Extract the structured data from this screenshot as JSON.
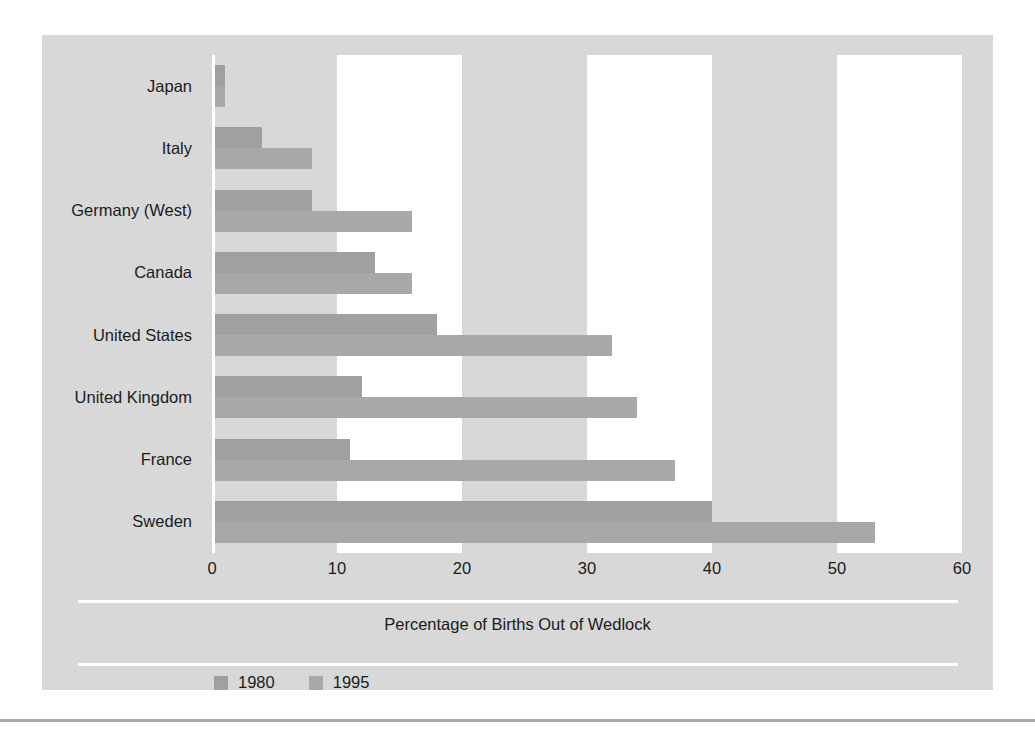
{
  "chart_data": {
    "type": "bar",
    "orientation": "horizontal",
    "title": "",
    "xlabel": "Percentage of Births Out of Wedlock",
    "ylabel": "",
    "xlim": [
      0,
      60
    ],
    "xticks": [
      0,
      10,
      20,
      30,
      40,
      50,
      60
    ],
    "xtick_labels": [
      "0",
      "10",
      "20",
      "30",
      "40",
      "50",
      "60"
    ],
    "grid": false,
    "banded_background": true,
    "legend_position": "bottom-left",
    "categories": [
      "Japan",
      "Italy",
      "Germany (West)",
      "Canada",
      "United States",
      "United Kingdom",
      "France",
      "Sweden"
    ],
    "series": [
      {
        "name": "1980",
        "color": "#a0a0a0",
        "values": [
          1,
          4,
          8,
          13,
          18,
          12,
          11,
          40
        ]
      },
      {
        "name": "1995",
        "color": "#a8a8a8",
        "values": [
          1,
          8,
          16,
          16,
          32,
          34,
          37,
          53
        ]
      }
    ]
  },
  "colors": {
    "panel_background": "#d8d8d8",
    "band_white": "#ffffff",
    "band_grey": "#d8d8d8",
    "bar_1980": "#a0a0a0",
    "bar_1995": "#a8a8a8",
    "text": "#1b1b1b",
    "page_rule": "#a9a9a9"
  }
}
